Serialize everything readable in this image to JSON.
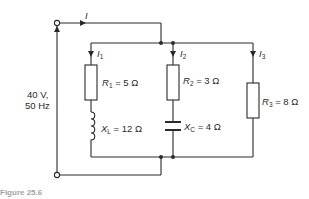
{
  "source": {
    "voltage": "40 V,",
    "frequency": "50 Hz"
  },
  "currents": {
    "total": "I",
    "branch1_symbol": "I",
    "branch1_sub": "1",
    "branch2_symbol": "I",
    "branch2_sub": "2",
    "branch3_symbol": "I",
    "branch3_sub": "3"
  },
  "components": {
    "r1": {
      "symbol": "R",
      "sub": "1",
      "value": " = 5 Ω"
    },
    "xl": {
      "symbol": "X",
      "sub": "L",
      "value": " = 12 Ω"
    },
    "r2": {
      "symbol": "R",
      "sub": "2",
      "value": " = 3 Ω"
    },
    "xc": {
      "symbol": "X",
      "sub": "C",
      "value": " = 4 Ω"
    },
    "r3": {
      "symbol": "R",
      "sub": "3",
      "value": " = 8 Ω"
    }
  },
  "caption": "Figure 25.6",
  "colors": {
    "line": "#2a2a2a",
    "background": "#ffffff"
  }
}
